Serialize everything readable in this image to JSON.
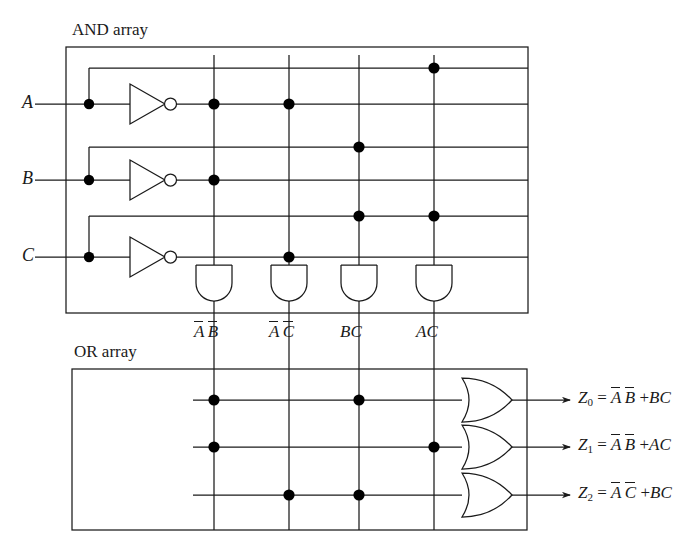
{
  "diagram": {
    "title_and": "AND array",
    "title_or": "OR array",
    "inputs": [
      {
        "name": "A",
        "y": 104
      },
      {
        "name": "B",
        "y": 180
      },
      {
        "name": "C",
        "y": 257
      }
    ],
    "input_rows": [
      {
        "label": "A",
        "kind": "true",
        "y": 68
      },
      {
        "label": "A'",
        "kind": "complement",
        "y": 104
      },
      {
        "label": "B",
        "kind": "true",
        "y": 147
      },
      {
        "label": "B'",
        "kind": "complement",
        "y": 180
      },
      {
        "label": "C",
        "kind": "true",
        "y": 216
      },
      {
        "label": "C'",
        "kind": "complement",
        "y": 257
      }
    ],
    "product_columns": [
      {
        "x": 214,
        "label_parts": [
          {
            "text": "A",
            "bar": true
          },
          {
            "text": "B",
            "bar": true
          }
        ],
        "connects_rows": [
          1,
          3
        ]
      },
      {
        "x": 289,
        "label_parts": [
          {
            "text": "A",
            "bar": true
          },
          {
            "text": "C",
            "bar": true
          }
        ],
        "connects_rows": [
          1,
          5
        ]
      },
      {
        "x": 359,
        "label_parts": [
          {
            "text": "B",
            "bar": false
          },
          {
            "text": "C",
            "bar": false
          }
        ],
        "connects_rows": [
          2,
          4
        ]
      },
      {
        "x": 434,
        "label_parts": [
          {
            "text": "A",
            "bar": false
          },
          {
            "text": "C",
            "bar": false
          }
        ],
        "connects_rows": [
          0,
          4
        ]
      }
    ],
    "outputs": [
      {
        "name": "Z",
        "sub": "0",
        "y": 400,
        "connects_columns": [
          0,
          2
        ],
        "terms": [
          {
            "text": "A",
            "bar": true
          },
          {
            "text": "B",
            "bar": true
          },
          {
            "text": "+",
            "bar": false
          },
          {
            "text": "BC",
            "bar": false
          }
        ]
      },
      {
        "name": "Z",
        "sub": "1",
        "y": 447,
        "connects_columns": [
          0,
          3
        ],
        "terms": [
          {
            "text": "A",
            "bar": true
          },
          {
            "text": "B",
            "bar": true
          },
          {
            "text": "+",
            "bar": false
          },
          {
            "text": "AC",
            "bar": false
          }
        ]
      },
      {
        "name": "Z",
        "sub": "2",
        "y": 495,
        "connects_columns": [
          1,
          2
        ],
        "terms": [
          {
            "text": "A",
            "bar": true
          },
          {
            "text": "C",
            "bar": true
          },
          {
            "text": "+",
            "bar": false
          },
          {
            "text": "BC",
            "bar": false
          }
        ]
      }
    ],
    "equations": [
      "Z0 = A'B' + BC",
      "Z1 = A'B' + AC",
      "Z2 = A'C' + BC"
    ],
    "and_box": {
      "x": 66,
      "y": 47,
      "w": 462,
      "h": 266
    },
    "or_box": {
      "x": 72,
      "y": 369,
      "w": 455,
      "h": 161
    },
    "colors": {
      "line": "#1a1a1a",
      "dot": "#000000",
      "background": "#ffffff"
    },
    "gate_labels": {
      "and_gate": "AND gate",
      "or_gate": "OR gate",
      "inverter": "inverter (NOT gate)"
    }
  }
}
